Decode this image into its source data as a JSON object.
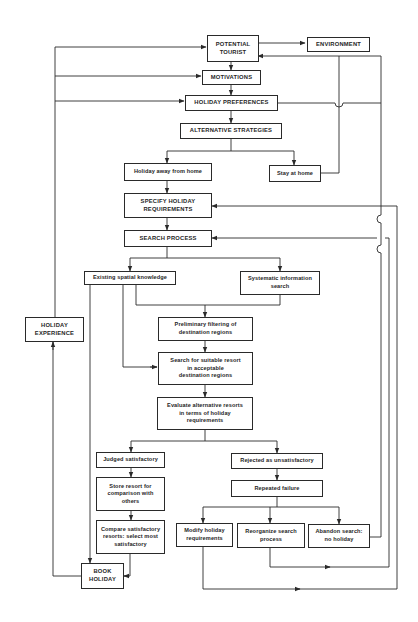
{
  "diagram": {
    "type": "flowchart",
    "topic": "Tourist holiday decision-making process",
    "nodes": {
      "potential_tourist": "POTENTIAL\nTOURIST",
      "environment": "ENVIRONMENT",
      "motivations": "MOTIVATIONS",
      "holiday_preferences": "HOLIDAY PREFERENCES",
      "alternative_strategies": "ALTERNATIVE STRATEGIES",
      "holiday_away": "Holiday away from home",
      "stay_at_home": "Stay at home",
      "specify_requirements": "SPECIFY HOLIDAY\nREQUIREMENTS",
      "search_process": "SEARCH PROCESS",
      "existing_knowledge": "Existing spatial knowledge",
      "systematic_search": "Systematic information\nsearch",
      "preliminary_filtering": "Preliminary filtering of\ndestination regions",
      "search_resort": "Search for suitable resort\nin acceptable\ndestination regions",
      "evaluate": "Evaluate alternative resorts\nin terms of holiday\nrequirements",
      "judged_satisfactory": "Judged satisfactory",
      "rejected": "Rejected as unsatisfactory",
      "store_resort": "Store resort for\ncomparison with\nothers",
      "repeated_failure": "Repeated failure",
      "compare": "Compare satisfactory\nresorts: select most\nsatisfactory",
      "modify": "Modify holiday\nrequirements",
      "reorganize": "Reorganize search\nprocess",
      "abandon": "Abandon search:\nno holiday",
      "book_holiday": "BOOK\nHOLIDAY",
      "holiday_experience": "HOLIDAY\nEXPERIENCE"
    },
    "edges": [
      [
        "potential_tourist",
        "environment",
        "bidirectional"
      ],
      [
        "potential_tourist",
        "motivations"
      ],
      [
        "motivations",
        "holiday_preferences"
      ],
      [
        "holiday_preferences",
        "alternative_strategies"
      ],
      [
        "holiday_preferences",
        "potential_tourist"
      ],
      [
        "alternative_strategies",
        "holiday_away"
      ],
      [
        "alternative_strategies",
        "stay_at_home"
      ],
      [
        "stay_at_home",
        "potential_tourist"
      ],
      [
        "holiday_away",
        "specify_requirements"
      ],
      [
        "specify_requirements",
        "search_process"
      ],
      [
        "search_process",
        "existing_knowledge"
      ],
      [
        "search_process",
        "systematic_search"
      ],
      [
        "existing_knowledge",
        "preliminary_filtering"
      ],
      [
        "systematic_search",
        "preliminary_filtering"
      ],
      [
        "existing_knowledge",
        "search_resort"
      ],
      [
        "existing_knowledge",
        "book_holiday"
      ],
      [
        "preliminary_filtering",
        "search_resort"
      ],
      [
        "search_resort",
        "evaluate"
      ],
      [
        "evaluate",
        "judged_satisfactory"
      ],
      [
        "evaluate",
        "rejected"
      ],
      [
        "judged_satisfactory",
        "store_resort"
      ],
      [
        "store_resort",
        "compare"
      ],
      [
        "compare",
        "book_holiday"
      ],
      [
        "rejected",
        "repeated_failure"
      ],
      [
        "repeated_failure",
        "modify"
      ],
      [
        "repeated_failure",
        "reorganize"
      ],
      [
        "repeated_failure",
        "abandon"
      ],
      [
        "abandon",
        "potential_tourist"
      ],
      [
        "reorganize",
        "search_process"
      ],
      [
        "modify",
        "specify_requirements"
      ],
      [
        "book_holiday",
        "holiday_experience"
      ],
      [
        "holiday_experience",
        "potential_tourist"
      ],
      [
        "holiday_experience",
        "motivations"
      ],
      [
        "holiday_experience",
        "holiday_preferences"
      ]
    ]
  },
  "colors": {
    "line": "#2a2a2a",
    "text": "#262626",
    "background": "#ffffff"
  }
}
